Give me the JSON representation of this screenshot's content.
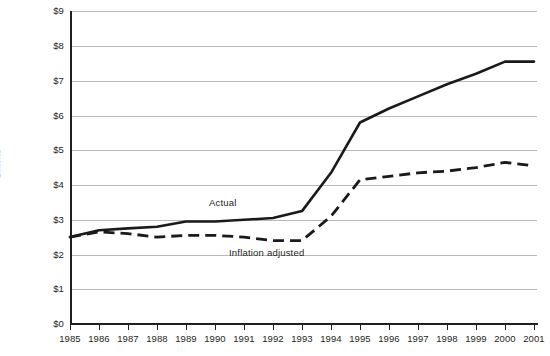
{
  "chart_data": {
    "type": "line",
    "title": "",
    "xlabel": "",
    "ylabel": "Billions",
    "grid": true,
    "legend_position": "inline-annotations",
    "x": [
      1985,
      1986,
      1987,
      1988,
      1989,
      1990,
      1991,
      1992,
      1993,
      1994,
      1995,
      1996,
      1997,
      1998,
      1999,
      2000,
      2001
    ],
    "categories": [
      "1985",
      "1986",
      "1987",
      "1988",
      "1989",
      "1990",
      "1991",
      "1992",
      "1993",
      "1994",
      "1995",
      "1996",
      "1997",
      "1998",
      "1999",
      "2000",
      "2001"
    ],
    "xlim": [
      1985,
      2001
    ],
    "ylim": [
      0,
      9
    ],
    "ytick_labels": [
      "$0",
      "$1",
      "$2",
      "$3",
      "$4",
      "$5",
      "$6",
      "$7",
      "$8",
      "$9"
    ],
    "ytick_values": [
      0,
      1,
      2,
      3,
      4,
      5,
      6,
      7,
      8,
      9
    ],
    "y_units": "Billions of dollars",
    "series": [
      {
        "name": "Actual",
        "style": "solid",
        "color": "#1a1a1a",
        "values": [
          2.5,
          2.7,
          2.75,
          2.8,
          2.95,
          2.95,
          3.0,
          3.05,
          3.25,
          4.35,
          5.8,
          6.2,
          6.55,
          6.9,
          7.2,
          7.55,
          7.55
        ]
      },
      {
        "name": "Inflation adjusted",
        "style": "dashed",
        "color": "#1a1a1a",
        "values": [
          2.5,
          2.65,
          2.6,
          2.5,
          2.55,
          2.55,
          2.5,
          2.4,
          2.4,
          3.1,
          4.15,
          4.25,
          4.35,
          4.4,
          4.5,
          4.65,
          4.55
        ]
      }
    ],
    "annotations": [
      {
        "text": "Actual",
        "x": 1989.8,
        "y": 3.6
      },
      {
        "text": "Inflation adjusted",
        "x": 1991.5,
        "y": 2.15
      }
    ]
  },
  "axis": {
    "y_title": "Billions"
  },
  "colors": {
    "ink": "#231f20",
    "grid": "#b9b9b9",
    "line": "#1a1a1a",
    "background": "#ffffff"
  }
}
